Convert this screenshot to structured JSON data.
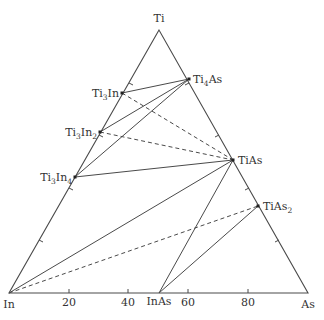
{
  "diagram": {
    "type": "ternary-phase-diagram",
    "vertices": {
      "top": {
        "label": "Ti"
      },
      "left": {
        "label": "In"
      },
      "right": {
        "label": "As"
      }
    },
    "bottom_axis_ticks": [
      "20",
      "40",
      "60",
      "80"
    ],
    "phases": [
      {
        "id": "Ti3In",
        "base": "Ti",
        "s1": "3",
        "mid": "In",
        "s2": ""
      },
      {
        "id": "Ti3In2",
        "base": "Ti",
        "s1": "3",
        "mid": "In",
        "s2": "2"
      },
      {
        "id": "Ti3In4",
        "base": "Ti",
        "s1": "3",
        "mid": "In",
        "s2": "4"
      },
      {
        "id": "Ti4As",
        "base": "Ti",
        "s1": "4",
        "mid": "As",
        "s2": ""
      },
      {
        "id": "TiAs",
        "text": "TiAs"
      },
      {
        "id": "TiAs2",
        "base": "TiAs",
        "s1": "2"
      },
      {
        "id": "InAs",
        "text": "InAs"
      }
    ],
    "tie_lines": [
      {
        "from": "Ti3In",
        "to": "Ti4As",
        "style": "solid"
      },
      {
        "from": "Ti3In2",
        "to": "Ti4As",
        "style": "solid"
      },
      {
        "from": "Ti3In4",
        "to": "Ti4As",
        "style": "solid"
      },
      {
        "from": "Ti3In",
        "to": "TiAs",
        "style": "dashed"
      },
      {
        "from": "Ti3In2",
        "to": "TiAs",
        "style": "dashed"
      },
      {
        "from": "Ti3In4",
        "to": "TiAs",
        "style": "solid"
      },
      {
        "from": "In",
        "to": "TiAs",
        "style": "solid"
      },
      {
        "from": "In",
        "to": "TiAs2",
        "style": "dashed"
      },
      {
        "from": "InAs",
        "to": "TiAs",
        "style": "solid"
      },
      {
        "from": "InAs",
        "to": "TiAs2",
        "style": "solid"
      }
    ]
  }
}
